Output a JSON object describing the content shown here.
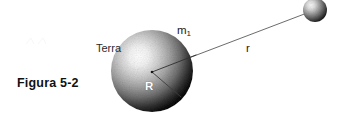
{
  "figure": {
    "caption": "Figura 5-2",
    "background_color": "#ffffff",
    "width": 348,
    "height": 128
  },
  "labels": {
    "earth": "Terra",
    "mass": "m",
    "mass_subscript": "1",
    "distance": "r",
    "radius": "R"
  },
  "diagram": {
    "type": "physics-gravitation-schematic",
    "earth_sphere": {
      "name": "Terra",
      "center_x": 152,
      "center_y": 71,
      "radius": 41,
      "highlight_x_pct": 34,
      "highlight_y_pct": 32,
      "light_color": "#fcfcfc",
      "mid_color": "#9a9a9a",
      "dark_color": "#0d0d0d"
    },
    "satellite_sphere": {
      "name": "m1",
      "center_x": 315,
      "center_y": 10,
      "radius": 12,
      "highlight_x_pct": 33,
      "highlight_y_pct": 30,
      "light_color": "#f2f2f2",
      "mid_color": "#8f8f8f",
      "dark_color": "#1c1c1c"
    },
    "distance_line": {
      "label": "r",
      "from_x": 152,
      "from_y": 72,
      "to_x": 307,
      "to_y": 13,
      "color": "#5a5a5a",
      "width": 0.9
    },
    "radius_line": {
      "label": "R",
      "from_x": 152,
      "from_y": 72,
      "to_x": 181,
      "to_y": 97,
      "color": "#4a4a4a",
      "width": 0.9
    }
  }
}
